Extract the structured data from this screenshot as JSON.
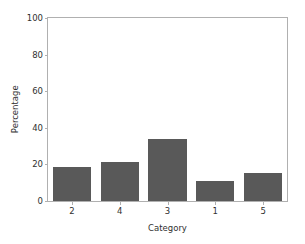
{
  "chart_data": {
    "type": "bar",
    "title": "",
    "xlabel": "Category",
    "ylabel": "Percentage",
    "categories": [
      "2",
      "4",
      "3",
      "1",
      "5"
    ],
    "values": [
      18.5,
      21.5,
      34.0,
      11.0,
      15.5
    ],
    "ylim": [
      0,
      100
    ],
    "yticks": [
      0,
      20,
      40,
      60,
      80,
      100
    ],
    "ytick_labels": [
      "0",
      "20",
      "40",
      "60",
      "80",
      "100"
    ],
    "xtick_labels": [
      "2",
      "4",
      "3",
      "1",
      "5"
    ],
    "grid": false,
    "legend": null,
    "bar_color": "#595959",
    "axes_color": "#b0b0b0",
    "text_color": "#303030",
    "background": "#ffffff"
  }
}
